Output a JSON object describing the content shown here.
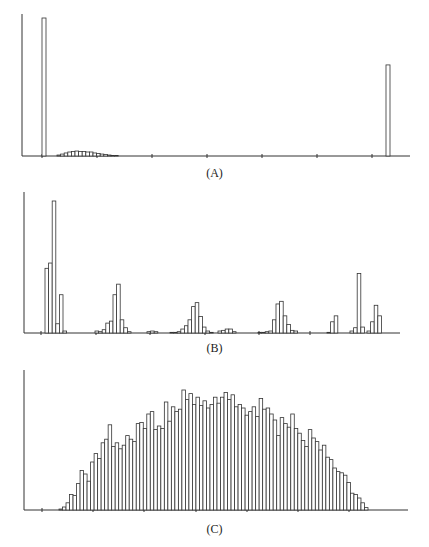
{
  "figure": {
    "panels": [
      {
        "id": "A",
        "label": "(A)"
      },
      {
        "id": "B",
        "label": "(B)"
      },
      {
        "id": "C",
        "label": "(C)"
      }
    ]
  },
  "chart_data": [
    {
      "type": "bar",
      "title": "",
      "caption": "(A)",
      "xlabel": "",
      "ylabel": "",
      "grid": false,
      "legend": null,
      "x_ticks": 7,
      "units": "relative height (tallest bar = 100)",
      "bars": [
        {
          "x": 0.0,
          "value": 100
        },
        {
          "x": 0.04,
          "value": 0.7
        },
        {
          "x": 0.05,
          "value": 1.4
        },
        {
          "x": 0.06,
          "value": 2.2
        },
        {
          "x": 0.07,
          "value": 2.9
        },
        {
          "x": 0.08,
          "value": 3.2
        },
        {
          "x": 0.09,
          "value": 3.6
        },
        {
          "x": 0.1,
          "value": 3.2
        },
        {
          "x": 0.11,
          "value": 3.2
        },
        {
          "x": 0.12,
          "value": 2.9
        },
        {
          "x": 0.13,
          "value": 2.9
        },
        {
          "x": 0.14,
          "value": 2.2
        },
        {
          "x": 0.15,
          "value": 1.8
        },
        {
          "x": 0.16,
          "value": 1.4
        },
        {
          "x": 0.17,
          "value": 1.1
        },
        {
          "x": 0.18,
          "value": 0.7
        },
        {
          "x": 0.19,
          "value": 0.4
        },
        {
          "x": 0.2,
          "value": 0.2
        },
        {
          "x": 1.0,
          "value": 66
        }
      ]
    },
    {
      "type": "bar",
      "title": "",
      "caption": "(B)",
      "xlabel": "",
      "ylabel": "",
      "grid": false,
      "legend": null,
      "x_ticks": 7,
      "units": "relative height (tallest bar = 100)",
      "clusters": [
        {
          "name": "cluster-1",
          "values": [
            49,
            53,
            100,
            7,
            29,
            1.5
          ]
        },
        {
          "name": "cluster-2",
          "values": [
            1.5,
            1,
            2.5,
            7.5,
            9,
            29,
            37,
            10,
            4,
            1
          ]
        },
        {
          "name": "cluster-3",
          "values": [
            1,
            1.5,
            1
          ]
        },
        {
          "name": "cluster-4",
          "values": [
            0.5,
            0.5,
            1,
            3,
            5.5,
            10,
            20,
            23,
            12.5,
            4.5,
            1.5,
            0.5
          ]
        },
        {
          "name": "cluster-5",
          "values": [
            1.5,
            2,
            3,
            3,
            1
          ]
        },
        {
          "name": "cluster-6",
          "values": [
            0.5,
            0.5,
            1,
            1.5,
            10,
            22,
            24,
            13,
            6.5,
            2,
            1.5
          ]
        },
        {
          "name": "cluster-7a",
          "values": [
            0.5,
            8.5,
            13
          ]
        },
        {
          "name": "cluster-7b",
          "values": [
            1.5,
            4,
            45,
            4.5
          ]
        },
        {
          "name": "cluster-7c",
          "values": [
            1.5,
            8.5,
            21,
            13
          ]
        }
      ]
    },
    {
      "type": "bar",
      "title": "",
      "caption": "(C)",
      "xlabel": "",
      "ylabel": "",
      "grid": false,
      "legend": null,
      "x_ticks": 7,
      "units": "relative height (tallest bar = 100)",
      "values": [
        0.8,
        2.5,
        6,
        13,
        12,
        22,
        33,
        30,
        24,
        40,
        47,
        43,
        56,
        59,
        71,
        53,
        56,
        51,
        54,
        62,
        59,
        57,
        72,
        73,
        68,
        80,
        82,
        67,
        70,
        68,
        90,
        74,
        86,
        82,
        84,
        100,
        92,
        97,
        88,
        94,
        87,
        91,
        85,
        88,
        94,
        89,
        94,
        98,
        92,
        96,
        86,
        88,
        85,
        79,
        82,
        86,
        78,
        93,
        84,
        85,
        80,
        75,
        62,
        77,
        72,
        69,
        80,
        68,
        64,
        58,
        53,
        67,
        60,
        57,
        50,
        54,
        44,
        42,
        35,
        32,
        31,
        29,
        23,
        14,
        13,
        10,
        6,
        2
      ]
    }
  ]
}
